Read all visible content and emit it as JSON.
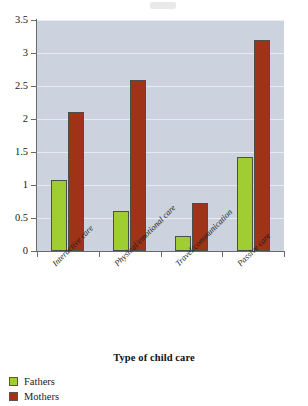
{
  "chart_data": {
    "type": "bar",
    "title": "",
    "xlabel": "Type of child care",
    "ylabel": "",
    "categories": [
      "Interactive care",
      "Physical/emotional care",
      "Travel/communication",
      "Passive care"
    ],
    "series": [
      {
        "name": "Fathers",
        "color": "#a0ce32",
        "values": [
          1.07,
          0.6,
          0.22,
          1.42
        ]
      },
      {
        "name": "Mothers",
        "color": "#9e3318",
        "values": [
          2.11,
          2.59,
          0.72,
          3.2
        ]
      }
    ],
    "ylim": [
      0,
      3.5
    ],
    "yticks": [
      "0",
      "0.5",
      "1",
      "1.5",
      "2",
      "2.5",
      "3",
      "3.5"
    ],
    "grid": "horizontal",
    "legend_position": "bottom-left",
    "plot_background": "#ccd3de"
  },
  "legend": {
    "items": [
      {
        "label": "Fathers"
      },
      {
        "label": "Mothers"
      }
    ]
  }
}
